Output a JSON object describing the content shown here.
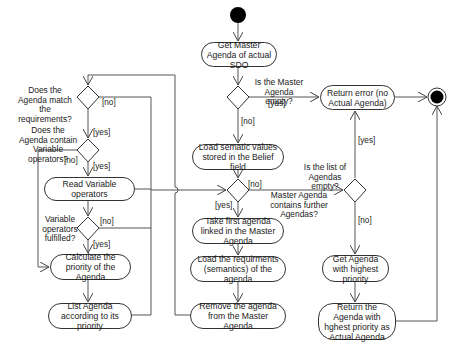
{
  "diagram": {
    "type": "uml-activity-diagram",
    "colors": {
      "line": "#444444",
      "node_border": "#333333",
      "fill": "#ffffff",
      "terminal": "#000000"
    },
    "actions": {
      "get_master_agenda": "Get Master Agenda of actual SDO",
      "return_error": "Return error (no Actual Agenda)",
      "load_semantic_values": "Load sematic values stored in the Belief field",
      "take_first_agenda": "Take first agenda linked in the Master Agenda",
      "load_requirements": "Load the requirments (semantics) of the agenda",
      "remove_agenda": "Remove the agenda from the Master Agenda",
      "get_highest_priority": "Get Agenda with highest priority",
      "return_highest": "Return the Agenda with hghest priority as Actual Agenda",
      "read_variable_operators": "Read Variable operators",
      "calculate_priority": "Calculate the priority of the Agenda",
      "list_agenda": "List Agenda according to its priority"
    },
    "decisions": {
      "master_empty": "Is the Master Agenda empty?",
      "further_agendas": "Master Agenda contains further Agendas?",
      "list_empty": "Is the list of Agendas empty?",
      "match_requirements": "Does the Agenda match the requirements?",
      "contain_variable": "Does the Agenda contain Variable operators?",
      "variable_fulfilled": "Variable operators fulfilled?"
    },
    "guards": {
      "yes": "[yes]",
      "no": "[no]"
    }
  }
}
